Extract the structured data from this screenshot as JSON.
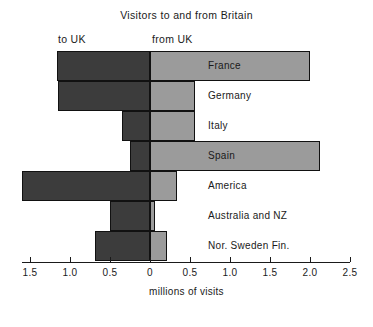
{
  "chart_data": {
    "type": "bar",
    "orientation": "horizontal",
    "title": "Visitors to and from Britain",
    "xlabel": "millions of visits",
    "ylabel": "",
    "grid": false,
    "legend_position": "top-inline",
    "axis": {
      "zero_at_px": 150,
      "px_per_unit": 80,
      "left_limit": -1.6,
      "right_limit": 2.5,
      "tick_values": [
        -1.5,
        -1.0,
        -0.5,
        0,
        0.5,
        1.0,
        1.5,
        2.0,
        2.5
      ],
      "tick_labels": [
        "1.5",
        "1.0",
        "0.5",
        "0",
        "0.5",
        "1.0",
        "1.5",
        "2.0",
        "2.5"
      ]
    },
    "direction_labels": {
      "left": "to UK",
      "right": "from UK"
    },
    "categories": [
      "France",
      "Germany",
      "Italy",
      "Spain",
      "America",
      "Australia and NZ",
      "Nor. Sweden Fin."
    ],
    "series": [
      {
        "name": "to UK",
        "color": "#3c3c3c",
        "values": [
          1.16,
          1.15,
          0.35,
          0.25,
          1.6,
          0.5,
          0.69
        ]
      },
      {
        "name": "from UK",
        "color": "#9b9b9b",
        "values": [
          2.0,
          0.56,
          0.56,
          2.12,
          0.34,
          0.06,
          0.21
        ]
      }
    ]
  },
  "rows": [
    {
      "label": "France",
      "to_uk": 1.16,
      "from_uk": 2.0,
      "label_x": 208
    },
    {
      "label": "Germany",
      "to_uk": 1.15,
      "from_uk": 0.56,
      "label_x": 208
    },
    {
      "label": "Italy",
      "to_uk": 0.35,
      "from_uk": 0.56,
      "label_x": 208
    },
    {
      "label": "Spain",
      "to_uk": 0.25,
      "from_uk": 2.12,
      "label_x": 208
    },
    {
      "label": "America",
      "to_uk": 1.6,
      "from_uk": 0.34,
      "label_x": 208
    },
    {
      "label": "Australia and NZ",
      "to_uk": 0.5,
      "from_uk": 0.06,
      "label_x": 208
    },
    {
      "label": "Nor. Sweden Fin.",
      "to_uk": 0.69,
      "from_uk": 0.21,
      "label_x": 208
    }
  ],
  "colors": {
    "to_uk_fill": "#3c3c3c",
    "from_uk_fill": "#9b9b9b",
    "outline": "#111111",
    "text": "#1a1a1a",
    "background": "#ffffff"
  }
}
